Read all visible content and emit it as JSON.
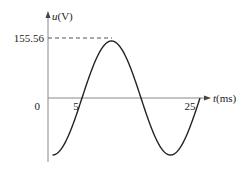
{
  "chart_data": {
    "type": "line",
    "title": "",
    "xlabel": "t(ms)",
    "ylabel": "u(V)",
    "x_label_var": "t",
    "x_label_unit": "(ms)",
    "y_label_var": "u",
    "y_label_unit": "(V)",
    "origin_label": "0",
    "x_ticks": [
      "5",
      "25"
    ],
    "y_ticks": [
      "155.56"
    ],
    "amplitude": 155.56,
    "period_ms": 20,
    "phase_zero_crossing_ms": 5,
    "function": "u(t) = 155.56 * sin(2*pi*(t-5)/20)",
    "x": [
      0,
      2.5,
      5,
      7.5,
      10,
      12.5,
      15,
      17.5,
      20,
      22.5,
      25
    ],
    "series": [
      {
        "name": "u(t)",
        "values": [
          -155.56,
          -110.0,
          0,
          110.0,
          155.56,
          110.0,
          0,
          -110.0,
          -155.56,
          -110.0,
          0
        ]
      }
    ],
    "xlim": [
      0,
      25
    ],
    "ylim": [
      -155.56,
      155.56
    ],
    "grid": false,
    "legend": "none",
    "annotations": [
      "dashed line from y-axis at 155.56 to the peak"
    ],
    "colors": {
      "curve": "#222222",
      "axes": "#888888",
      "dashed": "#555555"
    }
  }
}
